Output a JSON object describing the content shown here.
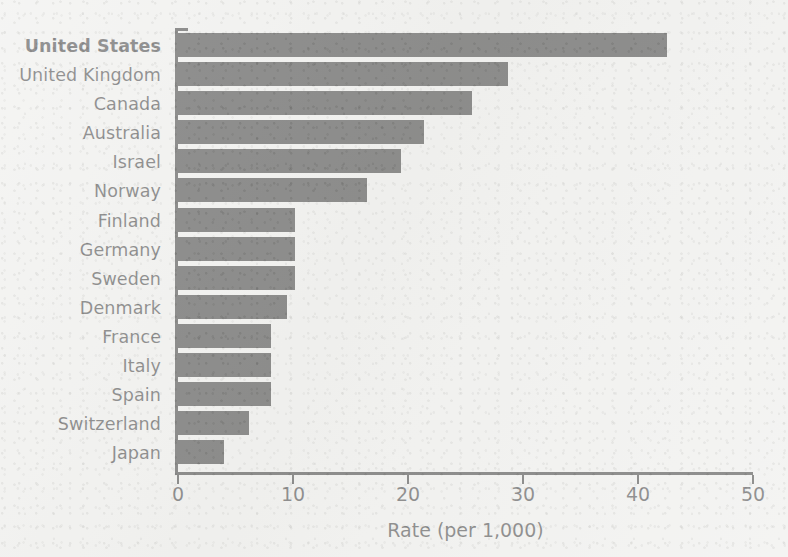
{
  "chart_data": {
    "type": "bar",
    "orientation": "horizontal",
    "title": "",
    "subtitle": "",
    "xlabel": "Rate (per 1,000)",
    "ylabel": "",
    "xlim": [
      0,
      50
    ],
    "xticks": [
      "0",
      "10",
      "20",
      "30",
      "40",
      "50"
    ],
    "xtick_values": [
      0,
      10,
      20,
      30,
      40,
      50
    ],
    "grid": false,
    "legend": null,
    "bar_color": "#141414",
    "background_color": "#f1f1ef",
    "emphasis_category": "United States",
    "categories": [
      "United States",
      "United Kingdom",
      "Canada",
      "Australia",
      "Israel",
      "Norway",
      "Finland",
      "Germany",
      "Sweden",
      "Denmark",
      "France",
      "Italy",
      "Spain",
      "Switzerland",
      "Japan"
    ],
    "values": [
      42.5,
      28.7,
      25.6,
      21.4,
      19.4,
      16.4,
      10.2,
      10.2,
      10.2,
      9.5,
      8.1,
      8.1,
      8.1,
      6.2,
      4.0
    ],
    "bars": [
      {
        "label": "United States",
        "value": 42.5,
        "emphasis": true
      },
      {
        "label": "United Kingdom",
        "value": 28.7,
        "emphasis": false
      },
      {
        "label": "Canada",
        "value": 25.6,
        "emphasis": false
      },
      {
        "label": "Australia",
        "value": 21.4,
        "emphasis": false
      },
      {
        "label": "Israel",
        "value": 19.4,
        "emphasis": false
      },
      {
        "label": "Norway",
        "value": 16.4,
        "emphasis": false
      },
      {
        "label": "Finland",
        "value": 10.2,
        "emphasis": false
      },
      {
        "label": "Germany",
        "value": 10.2,
        "emphasis": false
      },
      {
        "label": "Sweden",
        "value": 10.2,
        "emphasis": false
      },
      {
        "label": "Denmark",
        "value": 9.5,
        "emphasis": false
      },
      {
        "label": "France",
        "value": 8.1,
        "emphasis": false
      },
      {
        "label": "Italy",
        "value": 8.1,
        "emphasis": false
      },
      {
        "label": "Spain",
        "value": 8.1,
        "emphasis": false
      },
      {
        "label": "Switzerland",
        "value": 6.2,
        "emphasis": false
      },
      {
        "label": "Japan",
        "value": 4.0,
        "emphasis": false
      }
    ]
  }
}
